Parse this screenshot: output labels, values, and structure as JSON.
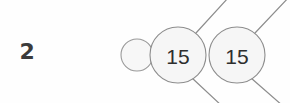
{
  "page": {
    "width": 290,
    "height": 103,
    "background_color": "#fefefe"
  },
  "problem": {
    "number_label": "2"
  },
  "diagram": {
    "type": "number-bond",
    "stroke_color": "#8d8d8d",
    "circle_fill_color": "#f6f6f6",
    "text_color": "#2e2e2e",
    "nodes": [
      {
        "name": "empty-small-circle",
        "label": "",
        "cx": 137,
        "cy": 55,
        "r": 16,
        "filled_text": false
      },
      {
        "name": "first-value-circle",
        "label": "15",
        "cx": 178,
        "cy": 55,
        "r": 28,
        "filled_text": true
      },
      {
        "name": "second-value-circle",
        "label": "15",
        "cx": 237,
        "cy": 55,
        "r": 28,
        "filled_text": true
      }
    ],
    "connectors": [
      {
        "name": "connector-up-left",
        "x1": 196,
        "y1": 33,
        "x2": 228,
        "y2": -2
      },
      {
        "name": "connector-up-right",
        "x1": 255,
        "y1": 33,
        "x2": 290,
        "y2": -4
      },
      {
        "name": "connector-down-left",
        "x1": 192,
        "y1": 78,
        "x2": 222,
        "y2": 106
      },
      {
        "name": "connector-down-right",
        "x1": 251,
        "y1": 78,
        "x2": 283,
        "y2": 106
      }
    ]
  }
}
